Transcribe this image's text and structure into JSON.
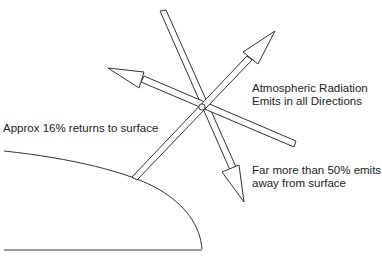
{
  "diagram": {
    "labels": {
      "returns": "Approx 16% returns to surface",
      "atmospheric_line1": "Atmospheric Radiation",
      "atmospheric_line2": "Emits in all Directions",
      "away_line1": "Far more than 50% emits",
      "away_line2": "away from surface"
    },
    "center": {
      "x": 202,
      "y": 107
    },
    "arrows": [
      {
        "name": "upper-right-arrow",
        "from": [
          134,
          179
        ],
        "tip": [
          275,
          31
        ]
      },
      {
        "name": "left-arrow",
        "from": [
          296,
          143
        ],
        "tip": [
          108,
          68
        ]
      },
      {
        "name": "down-right-arrow",
        "from": [
          163,
          11
        ],
        "tip": [
          244,
          202
        ]
      }
    ],
    "surface": {
      "curve_start": [
        4,
        151
      ],
      "curve_end": [
        202,
        249
      ],
      "baseline": [
        [
          4,
          250
        ],
        [
          202,
          250
        ]
      ]
    },
    "colors": {
      "stroke": "#333333",
      "background": "#ffffff",
      "text": "#222222"
    }
  }
}
